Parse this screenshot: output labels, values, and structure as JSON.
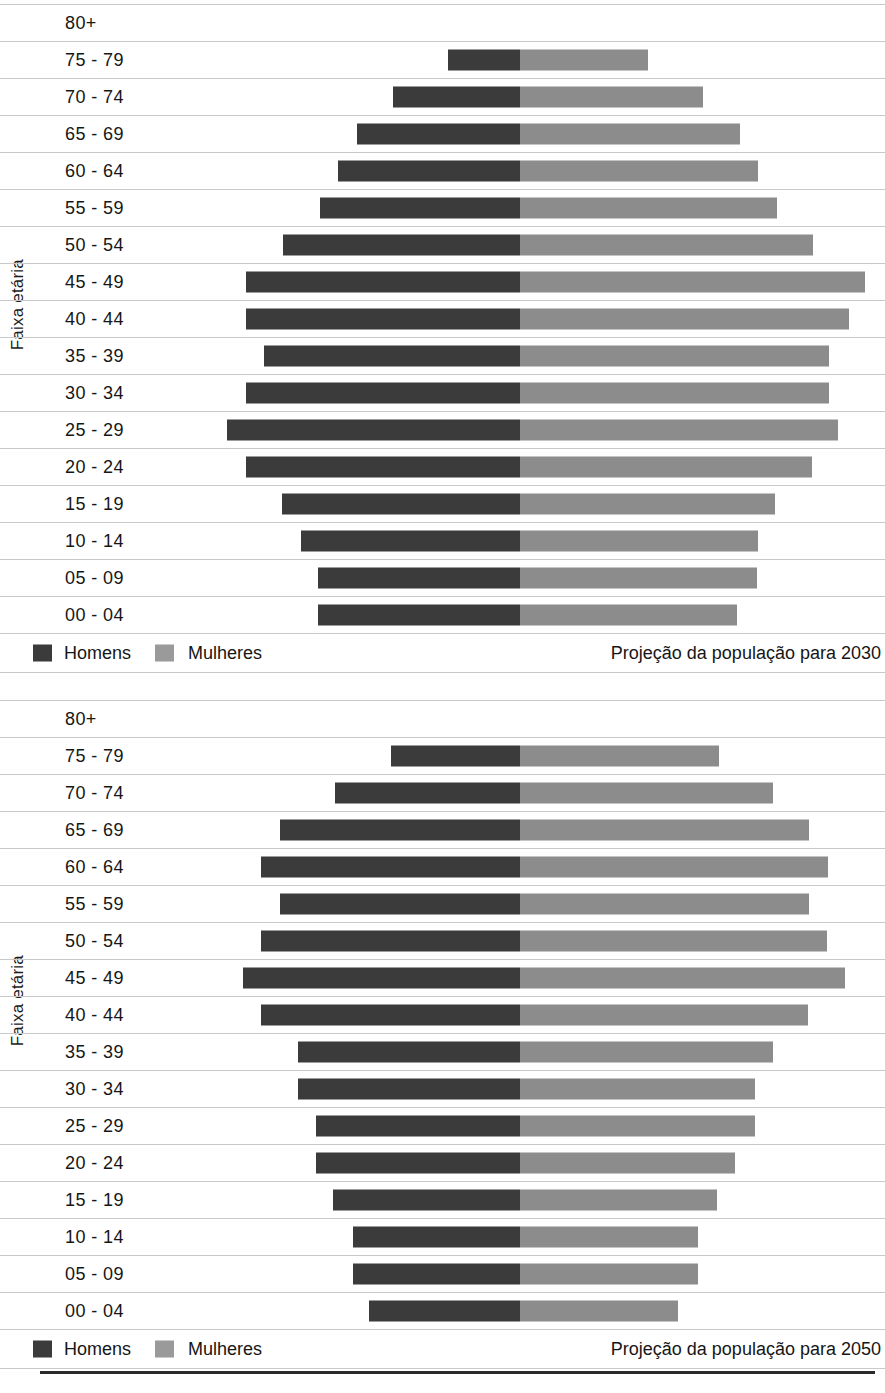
{
  "chart_data": [
    {
      "type": "bar",
      "subtype": "population-pyramid",
      "title": "Projeção da população para 2030",
      "ylabel": "Faixa etária",
      "xlabel": "",
      "grid": true,
      "legend_position": "bottom-left",
      "center_px": 520,
      "categories": [
        "80+",
        "75 - 79",
        "70 - 74",
        "65 - 69",
        "60 - 64",
        "55 - 59",
        "50 - 54",
        "45 - 49",
        "40 - 44",
        "35 - 39",
        "30 - 34",
        "25 - 29",
        "20 - 24",
        "15 - 19",
        "10 - 14",
        "05 - 09",
        "00 - 04"
      ],
      "series": [
        {
          "name": "Homens",
          "color": "#3b3b3b",
          "side": "left",
          "values": [
            0,
            72,
            127,
            163,
            182,
            200,
            237,
            274,
            274,
            256,
            274,
            293,
            274,
            238,
            219,
            202,
            202
          ]
        },
        {
          "name": "Mulheres",
          "color": "#8c8c8c",
          "side": "right",
          "values": [
            0,
            128,
            183,
            220,
            238,
            257,
            293,
            345,
            329,
            309,
            309,
            318,
            292,
            255,
            238,
            237,
            217
          ]
        }
      ]
    },
    {
      "type": "bar",
      "subtype": "population-pyramid",
      "title": "Projeção da população para 2050",
      "ylabel": "Faixa etária",
      "xlabel": "",
      "grid": true,
      "legend_position": "bottom-left",
      "center_px": 520,
      "categories": [
        "80+",
        "75 - 79",
        "70 - 74",
        "65 - 69",
        "60 - 64",
        "55 - 59",
        "50 - 54",
        "45 - 49",
        "40 - 44",
        "35 - 39",
        "30 - 34",
        "25 - 29",
        "20 - 24",
        "15 - 19",
        "10 - 14",
        "05 - 09",
        "00 - 04"
      ],
      "series": [
        {
          "name": "Homens",
          "color": "#3b3b3b",
          "side": "left",
          "values": [
            0,
            129,
            185,
            240,
            259,
            240,
            259,
            277,
            259,
            222,
            222,
            204,
            204,
            187,
            167,
            167,
            151
          ]
        },
        {
          "name": "Mulheres",
          "color": "#8c8c8c",
          "side": "right",
          "values": [
            0,
            199,
            253,
            289,
            308,
            289,
            307,
            325,
            288,
            253,
            235,
            235,
            215,
            197,
            178,
            178,
            158
          ]
        }
      ]
    }
  ],
  "charts": [
    {
      "axis_title": "Faixa etária",
      "rows": [
        {
          "label": "80+",
          "men": 0,
          "women": 0
        },
        {
          "label": "75 - 79",
          "men": 72,
          "women": 128
        },
        {
          "label": "70 - 74",
          "men": 127,
          "women": 183
        },
        {
          "label": "65 - 69",
          "men": 163,
          "women": 220
        },
        {
          "label": "60 - 64",
          "men": 182,
          "women": 238
        },
        {
          "label": "55 - 59",
          "men": 200,
          "women": 257
        },
        {
          "label": "50 - 54",
          "men": 237,
          "women": 293
        },
        {
          "label": "45 - 49",
          "men": 274,
          "women": 345
        },
        {
          "label": "40 - 44",
          "men": 274,
          "women": 329
        },
        {
          "label": "35 - 39",
          "men": 256,
          "women": 309
        },
        {
          "label": "30 - 34",
          "men": 274,
          "women": 309
        },
        {
          "label": "25 - 29",
          "men": 293,
          "women": 318
        },
        {
          "label": "20 - 24",
          "men": 274,
          "women": 292
        },
        {
          "label": "15 - 19",
          "men": 238,
          "women": 255
        },
        {
          "label": "10 - 14",
          "men": 219,
          "women": 238
        },
        {
          "label": "05 - 09",
          "men": 202,
          "women": 237
        },
        {
          "label": "00 - 04",
          "men": 202,
          "women": 217
        }
      ],
      "legend": {
        "men_label": "Homens",
        "women_label": "Mulheres",
        "caption": "Projeção da população para 2030"
      }
    },
    {
      "axis_title": "Faixa etária",
      "rows": [
        {
          "label": "80+",
          "men": 0,
          "women": 0
        },
        {
          "label": "75 - 79",
          "men": 129,
          "women": 199
        },
        {
          "label": "70 - 74",
          "men": 185,
          "women": 253
        },
        {
          "label": "65 - 69",
          "men": 240,
          "women": 289
        },
        {
          "label": "60 - 64",
          "men": 259,
          "women": 308
        },
        {
          "label": "55 - 59",
          "men": 240,
          "women": 289
        },
        {
          "label": "50 - 54",
          "men": 259,
          "women": 307
        },
        {
          "label": "45 - 49",
          "men": 277,
          "women": 325
        },
        {
          "label": "40 - 44",
          "men": 259,
          "women": 288
        },
        {
          "label": "35 - 39",
          "men": 222,
          "women": 253
        },
        {
          "label": "30 - 34",
          "men": 222,
          "women": 235
        },
        {
          "label": "25 - 29",
          "men": 204,
          "women": 235
        },
        {
          "label": "20 - 24",
          "men": 204,
          "women": 215
        },
        {
          "label": "15 - 19",
          "men": 187,
          "women": 197
        },
        {
          "label": "10 - 14",
          "men": 167,
          "women": 178
        },
        {
          "label": "05 - 09",
          "men": 167,
          "women": 178
        },
        {
          "label": "00 - 04",
          "men": 151,
          "women": 158
        }
      ],
      "legend": {
        "men_label": "Homens",
        "women_label": "Mulheres",
        "caption": "Projeção da população para 2050"
      }
    }
  ],
  "style": {
    "center_px": 520,
    "row_height": 37,
    "bar_height": 21,
    "men_color": "#3b3b3b",
    "women_color": "#8c8c8c",
    "gridline_color": "#c9c9c9",
    "rule_color": "#2b2b2b"
  }
}
